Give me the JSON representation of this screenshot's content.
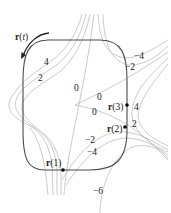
{
  "diagram": {
    "curve_label": {
      "r": "r",
      "open": "(",
      "t": "t",
      "close": ")"
    },
    "points": [
      {
        "name": "r(1)",
        "r": "r",
        "arg": "(1)"
      },
      {
        "name": "r(2)",
        "r": "r",
        "arg": "(2)"
      },
      {
        "name": "r(3)",
        "r": "r",
        "arg": "(3)"
      }
    ],
    "contour_labels": {
      "left_4": "4",
      "left_2": "2",
      "center_0": "0",
      "right_upper_0": "0",
      "right_lower_0": "0",
      "upper_right_neg4": "−4",
      "upper_right_neg2": "−2",
      "right_4": "4",
      "right_2": "2",
      "lower_neg2": "−2",
      "lower_neg4": "−4",
      "bottom_neg6": "−6"
    },
    "colors": {
      "curve": "#4a4a4a",
      "contours": "#b8b8b8",
      "text": "#222222",
      "points": "#000000"
    }
  }
}
